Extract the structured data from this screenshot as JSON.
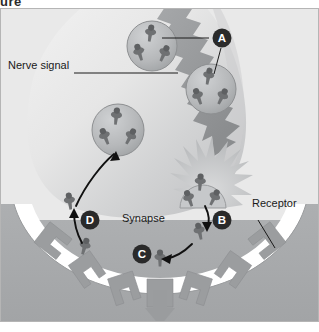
{
  "figure": {
    "top_fragment": "ure",
    "type": "biological-diagram",
    "palette": {
      "page_background": "#ffffff",
      "extracellular_upper": "#e8e8e8",
      "postsynaptic_cell": "#a8aaac",
      "neuron_terminal": "#e2e2e2",
      "neuron_shadow": "#c9cacb",
      "vesicle_fill": "#b9bbbd",
      "vesicle_stroke": "#8d8f91",
      "neurotransmitter": "#6f7173",
      "signal_arrow": "#9a9c9e",
      "receptor_block": "#9b9d9f",
      "marker_circle": "#2a2a2a",
      "marker_text": "#ffffff",
      "leader_line": "#1a1a1a",
      "label_text": "#1a1a1a",
      "frame_border": "#b5b5b5"
    }
  },
  "labels": {
    "nerve_signal": "Nerve signal",
    "synapse": "Synapse",
    "receptor": "Receptor"
  },
  "markers": [
    {
      "id": "A",
      "label": "A",
      "x": 222,
      "y": 30,
      "meaning": "Nerve signal travels down the axon to vesicles"
    },
    {
      "id": "B",
      "label": "B",
      "x": 222,
      "y": 212,
      "meaning": "Neurotransmitter released into the synapse"
    },
    {
      "id": "C",
      "label": "C",
      "x": 142,
      "y": 246,
      "meaning": "Neurotransmitter binds to receptor on target cell"
    },
    {
      "id": "D",
      "label": "D",
      "x": 90,
      "y": 212,
      "meaning": "Reuptake of neurotransmitter into the terminal"
    }
  ],
  "vesicles": [
    {
      "name": "vesicle-top",
      "cx": 152,
      "cy": 38,
      "r": 25,
      "molecules": 3
    },
    {
      "name": "vesicle-right",
      "cx": 211,
      "cy": 81,
      "r": 25,
      "molecules": 3
    },
    {
      "name": "vesicle-left",
      "cx": 118,
      "cy": 122,
      "r": 26,
      "molecules": 3
    },
    {
      "name": "vesicle-fusing",
      "cx": 203,
      "cy": 178,
      "r": 23,
      "molecules": 3
    }
  ],
  "leader_lines": [
    {
      "name": "leader-a-upper",
      "from": "marker-A",
      "to": "vesicle-top"
    },
    {
      "name": "leader-a-lower",
      "from": "marker-A",
      "to": "vesicle-right"
    },
    {
      "name": "leader-nerve-signal",
      "from": "label-nerve-signal",
      "to": "signal-arrow"
    },
    {
      "name": "leader-receptor",
      "from": "label-receptor",
      "to": "receptor-block"
    }
  ],
  "flow_arrows": [
    {
      "name": "arrow-release-b",
      "step": "B",
      "direction": "down",
      "description": "Neurotransmitter leaves fusing vesicle into synapse"
    },
    {
      "name": "arrow-bind-c",
      "step": "C",
      "direction": "down-left",
      "description": "Neurotransmitter moves toward receptor site"
    },
    {
      "name": "arrow-reuptake-d",
      "step": "D",
      "direction": "up",
      "description": "Neurotransmitter pulled back into terminal"
    },
    {
      "name": "arrow-recycle",
      "step": "D",
      "direction": "up-right",
      "description": "Recycled neurotransmitter repackaged into vesicle"
    },
    {
      "name": "arrow-signal",
      "step": "A",
      "direction": "down-right",
      "description": "Jagged nerve impulse travelling down the terminal"
    },
    {
      "name": "arrow-output",
      "step": "C",
      "direction": "down",
      "description": "Signal continues into the postsynaptic cell"
    }
  ],
  "receptor_sites": {
    "count": 7,
    "occupied_index": 3,
    "description": "Notched receptor blocks embedded in the postsynaptic membrane"
  }
}
